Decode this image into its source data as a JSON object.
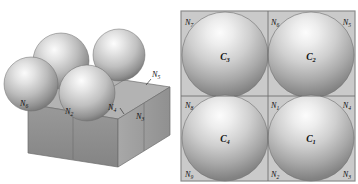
{
  "figure": {
    "top_clipped_text": "• • • • • • • • • • • • • • • • • • • •",
    "colors": {
      "panel_background": "#c9c9c9",
      "grid_line": "#6f6f6f",
      "frame_border": "#8a8a8a",
      "sphere_light": "#f2f2f2",
      "sphere_mid": "#bdbdbd",
      "sphere_dark": "#7b7b7b",
      "block_top": "#b5b5b5",
      "block_front": "#8e8e8e",
      "block_side": "#a3a3a3",
      "label_text": "#101010"
    }
  },
  "left_panel": {
    "name": "perspective-view",
    "spheres": [
      {
        "id": "sphere-back-left",
        "cx": 60,
        "cy": 56,
        "r": 28
      },
      {
        "id": "sphere-back-right",
        "cx": 118,
        "cy": 50,
        "r": 26
      },
      {
        "id": "sphere-front-left",
        "cx": 30,
        "cy": 78,
        "r": 27
      },
      {
        "id": "sphere-front-mid",
        "cx": 86,
        "cy": 88,
        "r": 28
      }
    ],
    "node_labels": [
      {
        "id": "left-N6",
        "base": "N",
        "sub": "6",
        "x": 22,
        "y": 99
      },
      {
        "id": "left-N2",
        "base": "N",
        "sub": "2",
        "x": 67,
        "y": 106
      },
      {
        "id": "left-N4",
        "base": "N",
        "sub": "4",
        "x": 110,
        "y": 102
      },
      {
        "id": "left-N3",
        "base": "N",
        "sub": "3",
        "x": 138,
        "y": 112
      },
      {
        "id": "left-N5",
        "base": "N",
        "sub": "5",
        "x": 154,
        "y": 69
      }
    ]
  },
  "right_panel": {
    "name": "top-view-grid",
    "cells": [
      {
        "id": "cell-C3",
        "base": "C",
        "sub": "3",
        "row": 0,
        "col": 0
      },
      {
        "id": "cell-C2",
        "base": "C",
        "sub": "2",
        "row": 0,
        "col": 1
      },
      {
        "id": "cell-C4",
        "base": "C",
        "sub": "4",
        "row": 1,
        "col": 0
      },
      {
        "id": "cell-C1",
        "base": "C",
        "sub": "1",
        "row": 1,
        "col": 1
      }
    ],
    "node_labels": [
      {
        "id": "right-N7",
        "base": "N",
        "sub": "7",
        "x": 7,
        "y": 15,
        "anchor": "start"
      },
      {
        "id": "right-N6",
        "base": "N",
        "sub": "6",
        "x": 90,
        "y": 15,
        "anchor": "start"
      },
      {
        "id": "right-N5",
        "base": "N",
        "sub": "5",
        "x": 169,
        "y": 15,
        "anchor": "end"
      },
      {
        "id": "right-N8",
        "base": "N",
        "sub": "8",
        "x": 7,
        "y": 95,
        "anchor": "start"
      },
      {
        "id": "right-N1",
        "base": "N",
        "sub": "1",
        "x": 90,
        "y": 95,
        "anchor": "start"
      },
      {
        "id": "right-N4",
        "base": "N",
        "sub": "4",
        "x": 169,
        "y": 95,
        "anchor": "end"
      },
      {
        "id": "right-N9",
        "base": "N",
        "sub": "9",
        "x": 7,
        "y": 166,
        "anchor": "start"
      },
      {
        "id": "right-N2",
        "base": "N",
        "sub": "2",
        "x": 90,
        "y": 166,
        "anchor": "start"
      },
      {
        "id": "right-N3",
        "base": "N",
        "sub": "3",
        "x": 169,
        "y": 166,
        "anchor": "end"
      }
    ]
  }
}
